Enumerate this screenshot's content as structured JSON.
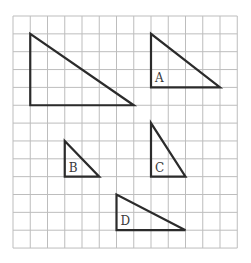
{
  "grid": {
    "cols": 13,
    "rows": 13,
    "origin_x": 13,
    "origin_y": 16,
    "cell_w": 17.25,
    "cell_h": 17.85,
    "line_color": "#bdbdbd"
  },
  "triangles": [
    {
      "name": "original",
      "label": "",
      "right_angle": [
        1,
        5
      ],
      "top": [
        1,
        1
      ],
      "right": [
        7,
        5
      ]
    },
    {
      "name": "A",
      "label": "A",
      "right_angle": [
        8,
        4
      ],
      "top": [
        8,
        1
      ],
      "right": [
        12,
        4
      ]
    },
    {
      "name": "B",
      "label": "B",
      "right_angle": [
        3,
        9
      ],
      "top": [
        3,
        7
      ],
      "right": [
        5,
        9
      ]
    },
    {
      "name": "C",
      "label": "C",
      "right_angle": [
        8,
        9
      ],
      "top": [
        8,
        6
      ],
      "right": [
        10,
        9
      ]
    },
    {
      "name": "D",
      "label": "D",
      "right_angle": [
        6,
        12
      ],
      "top": [
        6,
        10
      ],
      "right": [
        10,
        12
      ]
    }
  ],
  "stroke_color": "#2b2b2b"
}
